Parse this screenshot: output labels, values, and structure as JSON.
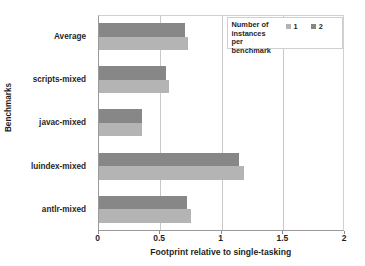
{
  "chart_data": {
    "type": "bar",
    "orientation": "horizontal",
    "title": "",
    "subtitle": "",
    "xlabel": "Footprint relative to single-tasking",
    "ylabel": "Benchmarks",
    "categories": [
      "Average",
      "scripts-mixed",
      "javac-mixed",
      "luindex-mixed",
      "antlr-mixed"
    ],
    "series": [
      {
        "name": "1",
        "color": "#b4b4b4",
        "values": [
          0.73,
          0.57,
          0.35,
          1.18,
          0.75
        ]
      },
      {
        "name": "2",
        "color": "#878787",
        "values": [
          0.7,
          0.55,
          0.35,
          1.14,
          0.72
        ]
      }
    ],
    "xlim": [
      0,
      2
    ],
    "xticks": [
      0,
      0.5,
      1,
      1.5,
      2
    ],
    "xtick_labels": [
      "0",
      "0.5",
      "1",
      "1.5",
      "2"
    ],
    "gridlines_x": [
      0.5,
      1,
      1.5
    ],
    "grid": true,
    "legend_position": "top-right-inside",
    "legend_title": "Number of\ninstances\nper benchmark",
    "legend_title_lines": [
      "Number of",
      "instances",
      "per benchmark"
    ]
  },
  "legend": {
    "title_line_1": "Number of",
    "title_line_2": "instances",
    "title_line_3": "per benchmark",
    "item_1_label": "1",
    "item_2_label": "2"
  },
  "axes": {
    "x_title": "Footprint relative to single-tasking",
    "y_title": "Benchmarks",
    "x_tick_0": "0",
    "x_tick_1": "0.5",
    "x_tick_2": "1",
    "x_tick_3": "1.5",
    "x_tick_4": "2"
  },
  "categories": {
    "cat_0": "Average",
    "cat_1": "scripts-mixed",
    "cat_2": "javac-mixed",
    "cat_3": "luindex-mixed",
    "cat_4": "antlr-mixed"
  },
  "colors": {
    "series_1": "#b4b4b4",
    "series_2": "#878787",
    "axis": "#9a9a9a",
    "grid": "#c8c8c8",
    "text": "#1f1f1f"
  }
}
